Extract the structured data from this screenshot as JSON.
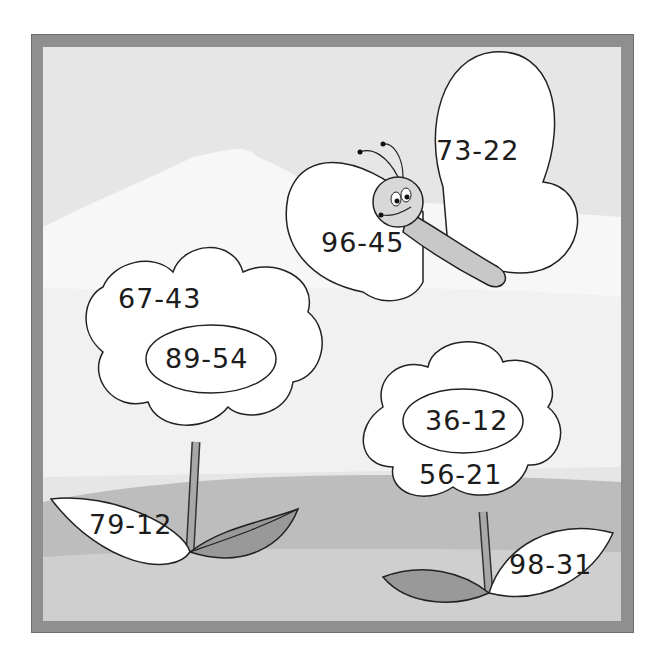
{
  "worksheet": {
    "type": "subtraction-coloring-puzzle",
    "frame_color": "#8f8f8f",
    "butterfly": {
      "upper_wing": "73-22",
      "lower_wing": "96-45"
    },
    "left_flower": {
      "petal_outer": "67-43",
      "center": "89-54",
      "leaf": "79-12"
    },
    "right_flower": {
      "center": "36-12",
      "petal_outer": "56-21",
      "leaf": "98-31"
    }
  }
}
